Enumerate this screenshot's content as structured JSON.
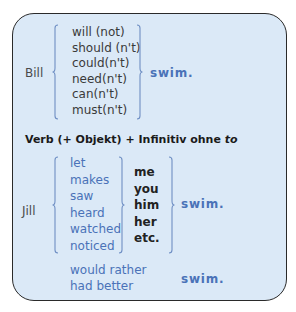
{
  "colors": {
    "box_fill": "#dbe9f7",
    "box_border": "#2a2a2a",
    "accent_blue": "#4a72b8",
    "text_dark": "#222222",
    "text_grey": "#4a4a4a"
  },
  "section1": {
    "subject": "Bill",
    "modals": [
      "will (not)",
      "should (n't)",
      "could(n't)",
      "need(n't)",
      "can(n't)",
      "must(n't)"
    ],
    "infinitive": "swim."
  },
  "heading": {
    "prefix": "Verb (+ Objekt) + Infinitiv ohne ",
    "italic_word": "to"
  },
  "section2": {
    "subject": "Jill",
    "verbs": [
      "let",
      "makes",
      "saw",
      "heard",
      "watched",
      "noticed"
    ],
    "objects": [
      "me",
      "you",
      "him",
      "her",
      "etc."
    ],
    "infinitive": "swim."
  },
  "section3": {
    "phrases": [
      "would rather",
      "had better"
    ],
    "infinitive": "swim."
  }
}
